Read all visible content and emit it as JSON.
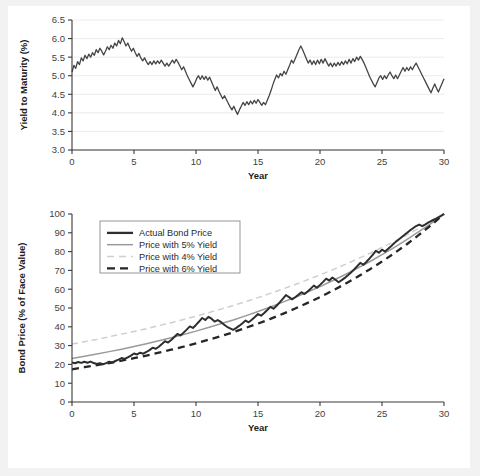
{
  "figure": {
    "background_color": "#f2f2f2",
    "panel_color": "#ffffff"
  },
  "chart_data": [
    {
      "type": "line",
      "id": "yield-to-maturity",
      "title": "",
      "xlabel": "Year",
      "ylabel": "Yield to Maturity (%)",
      "xlim": [
        0,
        30
      ],
      "ylim": [
        3.0,
        6.5
      ],
      "xticks": [
        0,
        5,
        10,
        15,
        20,
        25,
        30
      ],
      "yticks": [
        3.0,
        3.5,
        4.0,
        4.5,
        5.0,
        5.5,
        6.0,
        6.5
      ],
      "ytick_labels": [
        "3.0",
        "3.5",
        "4.0",
        "4.5",
        "5.0",
        "5.5",
        "6.0",
        "6.5"
      ],
      "xtick_labels": [
        "0",
        "5",
        "10",
        "15",
        "20",
        "25",
        "30"
      ],
      "grid": "horizontal",
      "legend": null,
      "series": [
        {
          "name": "Yield to Maturity",
          "color": "#454545",
          "width": 1.3,
          "dash": "none",
          "x": [
            0,
            0.15,
            0.3,
            0.45,
            0.6,
            0.75,
            0.9,
            1.05,
            1.2,
            1.35,
            1.5,
            1.65,
            1.8,
            1.95,
            2.1,
            2.25,
            2.4,
            2.55,
            2.7,
            2.85,
            3,
            3.15,
            3.3,
            3.45,
            3.6,
            3.75,
            3.9,
            4.05,
            4.2,
            4.35,
            4.5,
            4.65,
            4.8,
            4.95,
            5.1,
            5.25,
            5.4,
            5.55,
            5.7,
            5.85,
            6,
            6.15,
            6.3,
            6.45,
            6.6,
            6.75,
            6.9,
            7.05,
            7.2,
            7.35,
            7.5,
            7.65,
            7.8,
            7.95,
            8.1,
            8.25,
            8.4,
            8.55,
            8.7,
            8.85,
            9,
            9.15,
            9.3,
            9.45,
            9.6,
            9.75,
            9.9,
            10.05,
            10.2,
            10.35,
            10.5,
            10.65,
            10.8,
            10.95,
            11.1,
            11.25,
            11.4,
            11.55,
            11.7,
            11.85,
            12,
            12.15,
            12.3,
            12.45,
            12.6,
            12.75,
            12.9,
            13.05,
            13.2,
            13.35,
            13.5,
            13.65,
            13.8,
            13.95,
            14.1,
            14.25,
            14.4,
            14.55,
            14.7,
            14.85,
            15,
            15.15,
            15.3,
            15.45,
            15.6,
            15.75,
            15.9,
            16.05,
            16.2,
            16.35,
            16.5,
            16.65,
            16.8,
            16.95,
            17.1,
            17.25,
            17.4,
            17.55,
            17.7,
            17.85,
            18,
            18.15,
            18.3,
            18.45,
            18.6,
            18.75,
            18.9,
            19.05,
            19.2,
            19.35,
            19.5,
            19.65,
            19.8,
            19.95,
            20.1,
            20.25,
            20.4,
            20.55,
            20.7,
            20.85,
            21,
            21.15,
            21.3,
            21.45,
            21.6,
            21.75,
            21.9,
            22.05,
            22.2,
            22.35,
            22.5,
            22.65,
            22.8,
            22.95,
            23.1,
            23.25,
            23.4,
            23.55,
            23.7,
            23.85,
            24,
            24.15,
            24.3,
            24.45,
            24.6,
            24.75,
            24.9,
            25.05,
            25.2,
            25.35,
            25.5,
            25.65,
            25.8,
            25.95,
            26.1,
            26.25,
            26.4,
            26.55,
            26.7,
            26.85,
            27,
            27.15,
            27.3,
            27.45,
            27.6,
            27.75,
            27.9,
            28.05,
            28.2,
            28.35,
            28.5,
            28.65,
            28.8,
            28.95,
            29.1,
            29.25,
            29.4,
            29.55,
            29.7,
            29.85,
            30
          ],
          "y": [
            5.1,
            5.28,
            5.2,
            5.38,
            5.3,
            5.48,
            5.4,
            5.55,
            5.46,
            5.58,
            5.5,
            5.62,
            5.55,
            5.7,
            5.62,
            5.74,
            5.66,
            5.56,
            5.66,
            5.78,
            5.7,
            5.82,
            5.74,
            5.88,
            5.8,
            5.95,
            5.86,
            6.02,
            5.92,
            5.8,
            5.88,
            5.76,
            5.66,
            5.74,
            5.62,
            5.52,
            5.6,
            5.48,
            5.4,
            5.48,
            5.38,
            5.3,
            5.38,
            5.3,
            5.4,
            5.32,
            5.4,
            5.33,
            5.42,
            5.34,
            5.26,
            5.34,
            5.26,
            5.34,
            5.42,
            5.34,
            5.44,
            5.36,
            5.26,
            5.16,
            5.24,
            5.12,
            5.0,
            4.9,
            4.8,
            4.7,
            4.8,
            4.92,
            5.0,
            4.9,
            5.0,
            4.9,
            4.98,
            4.88,
            4.96,
            4.84,
            4.72,
            4.6,
            4.7,
            4.58,
            4.48,
            4.38,
            4.46,
            4.36,
            4.26,
            4.16,
            4.08,
            4.18,
            4.06,
            3.96,
            4.08,
            4.18,
            4.28,
            4.2,
            4.3,
            4.22,
            4.32,
            4.24,
            4.34,
            4.26,
            4.36,
            4.28,
            4.2,
            4.28,
            4.22,
            4.34,
            4.46,
            4.6,
            4.76,
            4.9,
            5.02,
            4.94,
            5.06,
            5.0,
            5.12,
            5.04,
            5.16,
            5.28,
            5.42,
            5.34,
            5.46,
            5.58,
            5.7,
            5.8,
            5.7,
            5.58,
            5.46,
            5.34,
            5.42,
            5.3,
            5.4,
            5.3,
            5.42,
            5.32,
            5.44,
            5.34,
            5.46,
            5.36,
            5.26,
            5.34,
            5.24,
            5.34,
            5.26,
            5.36,
            5.28,
            5.38,
            5.3,
            5.4,
            5.32,
            5.44,
            5.34,
            5.46,
            5.38,
            5.5,
            5.42,
            5.52,
            5.44,
            5.34,
            5.22,
            5.1,
            4.98,
            4.88,
            4.78,
            4.7,
            4.82,
            4.94,
            5.0,
            4.9,
            5.0,
            4.92,
            5.02,
            5.1,
            5.0,
            4.92,
            5.02,
            4.92,
            5.02,
            5.12,
            5.22,
            5.12,
            5.22,
            5.14,
            5.24,
            5.16,
            5.26,
            5.34,
            5.24,
            5.14,
            5.04,
            4.94,
            4.84,
            4.74,
            4.64,
            4.54,
            4.66,
            4.78,
            4.66,
            4.56,
            4.68,
            4.8,
            4.92,
            5.04,
            5.2,
            5.36,
            5.5,
            5.4,
            5.52,
            5.42,
            5.56,
            5.48,
            5.58,
            5.5,
            5.62,
            5.54,
            5.66,
            5.56,
            5.68,
            5.6,
            5.72,
            5.62,
            5.74,
            5.8,
            5.72,
            5.62,
            5.52,
            5.42,
            5.52,
            5.42,
            5.52,
            5.4,
            5.5,
            5.4,
            5.5,
            5.42,
            5.52,
            5.44,
            5.56,
            5.48,
            5.6,
            5.52,
            5.64,
            5.56,
            5.68,
            5.6,
            5.7
          ]
        }
      ]
    },
    {
      "type": "line",
      "id": "bond-price",
      "title": "",
      "xlabel": "Year",
      "ylabel": "Bond Price (% of Face Value)",
      "xlim": [
        0,
        30
      ],
      "ylim": [
        0,
        100
      ],
      "xticks": [
        0,
        5,
        10,
        15,
        20,
        25,
        30
      ],
      "yticks": [
        0,
        10,
        20,
        30,
        40,
        50,
        60,
        70,
        80,
        90,
        100
      ],
      "ytick_labels": [
        "0",
        "10",
        "20",
        "30",
        "40",
        "50",
        "60",
        "70",
        "80",
        "90",
        "100"
      ],
      "xtick_labels": [
        "0",
        "5",
        "10",
        "15",
        "20",
        "25",
        "30"
      ],
      "grid": "none",
      "legend": {
        "position": "upper-left",
        "entries": [
          {
            "label": "Actual Bond Price",
            "color": "#2e2e2e",
            "dash": "none",
            "width": 2.3
          },
          {
            "label": "Price with 5% Yield",
            "color": "#9a9a9a",
            "dash": "none",
            "width": 1.5
          },
          {
            "label": "Price with 4% Yield",
            "color": "#cfcfcf",
            "dash": "dashed",
            "width": 1.5
          },
          {
            "label": "Price with 6% Yield",
            "color": "#262626",
            "dash": "dashed",
            "width": 2.3
          }
        ]
      },
      "series": [
        {
          "name": "Price with 4% Yield",
          "color": "#cfcfcf",
          "width": 1.5,
          "dash": "dashed",
          "x": [
            0,
            1,
            2,
            3,
            4,
            5,
            6,
            7,
            8,
            9,
            10,
            11,
            12,
            13,
            14,
            15,
            16,
            17,
            18,
            19,
            20,
            21,
            22,
            23,
            24,
            25,
            26,
            27,
            28,
            29,
            30
          ],
          "y": [
            30.8,
            32.1,
            33.3,
            34.7,
            36.1,
            37.5,
            39.0,
            40.6,
            42.2,
            43.9,
            45.6,
            47.5,
            49.4,
            51.3,
            53.4,
            55.5,
            57.8,
            60.1,
            62.5,
            65.0,
            67.6,
            70.3,
            73.1,
            76.0,
            79.0,
            82.2,
            85.5,
            88.9,
            92.5,
            96.2,
            100.0
          ]
        },
        {
          "name": "Price with 5% Yield",
          "color": "#9a9a9a",
          "width": 1.5,
          "dash": "none",
          "x": [
            0,
            1,
            2,
            3,
            4,
            5,
            6,
            7,
            8,
            9,
            10,
            11,
            12,
            13,
            14,
            15,
            16,
            17,
            18,
            19,
            20,
            21,
            22,
            23,
            24,
            25,
            26,
            27,
            28,
            29,
            30
          ],
          "y": [
            23.1,
            24.3,
            25.5,
            26.8,
            28.1,
            29.5,
            31.0,
            32.6,
            34.2,
            35.9,
            37.7,
            39.6,
            41.6,
            43.6,
            45.8,
            48.1,
            50.5,
            53.1,
            55.7,
            58.5,
            61.4,
            64.5,
            67.7,
            71.1,
            74.6,
            78.4,
            82.3,
            86.4,
            90.7,
            95.2,
            100.0
          ]
        },
        {
          "name": "Price with 6% Yield",
          "color": "#262626",
          "width": 2.3,
          "dash": "dashed",
          "x": [
            0,
            1,
            2,
            3,
            4,
            5,
            6,
            7,
            8,
            9,
            10,
            11,
            12,
            13,
            14,
            15,
            16,
            17,
            18,
            19,
            20,
            21,
            22,
            23,
            24,
            25,
            26,
            27,
            28,
            29,
            30
          ],
          "y": [
            17.4,
            18.5,
            19.6,
            20.7,
            22.0,
            23.3,
            24.7,
            26.2,
            27.8,
            29.4,
            31.2,
            33.1,
            35.0,
            37.1,
            39.4,
            41.7,
            44.2,
            46.9,
            49.7,
            52.7,
            55.8,
            59.2,
            62.7,
            66.5,
            70.5,
            74.7,
            79.2,
            83.9,
            89.0,
            94.3,
            100.0
          ]
        },
        {
          "name": "Actual Bond Price",
          "color": "#2e2e2e",
          "width": 2.0,
          "dash": "none",
          "x": [
            0,
            0.25,
            0.5,
            0.75,
            1,
            1.25,
            1.5,
            1.75,
            2,
            2.25,
            2.5,
            2.75,
            3,
            3.25,
            3.5,
            3.75,
            4,
            4.25,
            4.5,
            4.75,
            5,
            5.25,
            5.5,
            5.75,
            6,
            6.25,
            6.5,
            6.75,
            7,
            7.25,
            7.5,
            7.75,
            8,
            8.25,
            8.5,
            8.75,
            9,
            9.25,
            9.5,
            9.75,
            10,
            10.25,
            10.5,
            10.75,
            11,
            11.25,
            11.5,
            11.75,
            12,
            12.25,
            12.5,
            12.75,
            13,
            13.25,
            13.5,
            13.75,
            14,
            14.25,
            14.5,
            14.75,
            15,
            15.25,
            15.5,
            15.75,
            16,
            16.25,
            16.5,
            16.75,
            17,
            17.25,
            17.5,
            17.75,
            18,
            18.25,
            18.5,
            18.75,
            19,
            19.25,
            19.5,
            19.75,
            20,
            20.25,
            20.5,
            20.75,
            21,
            21.25,
            21.5,
            21.75,
            22,
            22.25,
            22.5,
            22.75,
            23,
            23.25,
            23.5,
            23.75,
            24,
            24.25,
            24.5,
            24.75,
            25,
            25.25,
            25.5,
            25.75,
            26,
            26.25,
            26.5,
            26.75,
            27,
            27.25,
            27.5,
            27.75,
            28,
            28.25,
            28.5,
            28.75,
            29,
            29.25,
            29.5,
            29.75,
            30
          ],
          "y": [
            21.0,
            20.6,
            21.3,
            20.8,
            21.4,
            20.9,
            21.5,
            20.7,
            20.2,
            20.6,
            20.1,
            20.7,
            21.4,
            21.0,
            21.8,
            22.5,
            23.4,
            22.9,
            23.8,
            24.7,
            25.8,
            25.3,
            26.2,
            25.7,
            26.6,
            27.6,
            28.9,
            28.3,
            29.4,
            30.8,
            32.3,
            31.6,
            33.0,
            34.6,
            36.2,
            35.4,
            36.9,
            38.5,
            40.2,
            39.4,
            41.0,
            42.8,
            44.7,
            43.6,
            45.3,
            44.3,
            42.8,
            43.6,
            42.6,
            41.2,
            40.0,
            39.2,
            38.4,
            39.4,
            40.6,
            41.9,
            43.3,
            42.4,
            43.7,
            45.2,
            46.8,
            45.9,
            47.3,
            48.9,
            50.6,
            49.6,
            51.2,
            53.0,
            54.9,
            56.9,
            55.8,
            54.6,
            55.7,
            57.0,
            58.4,
            57.4,
            58.8,
            60.3,
            61.9,
            60.8,
            62.3,
            63.9,
            65.6,
            64.6,
            66.2,
            65.0,
            63.7,
            64.8,
            66.0,
            67.4,
            68.9,
            70.5,
            72.2,
            74.0,
            73.0,
            74.6,
            76.4,
            78.3,
            80.4,
            79.4,
            81.0,
            80.0,
            81.5,
            83.0,
            84.6,
            85.9,
            87.2,
            88.6,
            89.9,
            91.2,
            92.4,
            93.6,
            94.4,
            93.6,
            94.5,
            95.5,
            96.4,
            97.2,
            98.1,
            99.0,
            100.0,
            100.6,
            101.0
          ]
        }
      ]
    }
  ]
}
